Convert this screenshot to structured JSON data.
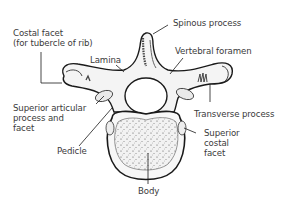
{
  "diagram": {
    "labels": {
      "costal_facet": "Costal facet\n(for tubercle of rib)",
      "lamina": "Lamina",
      "spinous_process": "Spinous process",
      "vertebral_foramen": "Vertebral foramen",
      "transverse_process": "Transverse process",
      "superior_articular": "Superior articular\nprocess and\nfacet",
      "superior_costal_facet": "Superior\ncostal\nfacet",
      "pedicle": "Pedicle",
      "body": "Body"
    },
    "colors": {
      "line": "#1a1a1a",
      "text": "#3a3a3a",
      "bone_fill": "#f4f4f4",
      "background": "#ffffff"
    }
  }
}
